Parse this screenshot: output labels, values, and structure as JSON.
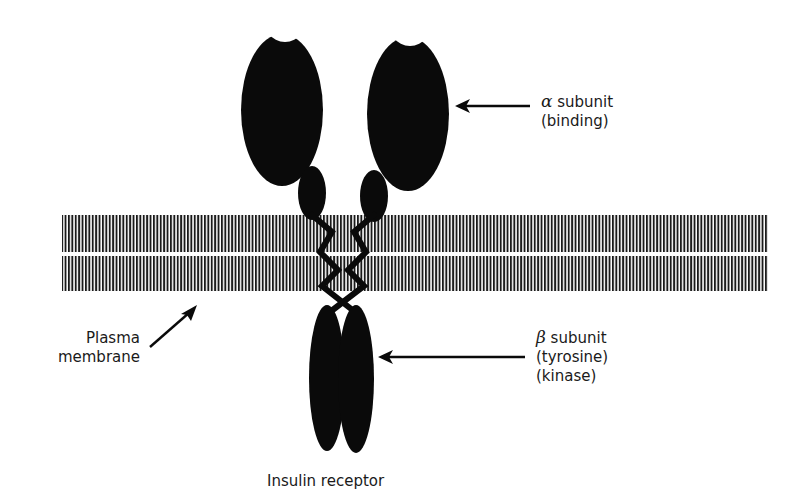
{
  "figure": {
    "title": "Insulin receptor",
    "colors": {
      "ink": "#0a0a0a",
      "membrane_stripes": "#1a1a1a",
      "background": "#ffffff"
    }
  },
  "labels": {
    "alpha": {
      "symbol": "α",
      "line1": "subunit",
      "line2": "(binding)"
    },
    "beta": {
      "symbol": "β",
      "line1": "subunit",
      "line2": "(tyrosine)",
      "line3": "(kinase)"
    },
    "membrane": {
      "line1": "Plasma",
      "line2": "membrane"
    },
    "caption": "Insulin receptor"
  }
}
